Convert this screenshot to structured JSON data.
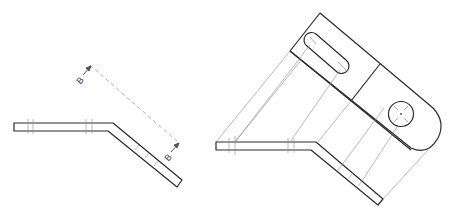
{
  "drawing": {
    "type": "auxiliary-view-projection",
    "views": [
      {
        "name": "edge-view",
        "description": "Bent plate shown edge-on with inclined segment"
      },
      {
        "name": "auxiliary-view",
        "description": "True-size view of inclined face with slot and hole, projected from edge view"
      }
    ],
    "section_markers": {
      "start_label": "B",
      "end_label": "B"
    },
    "colors": {
      "object_line": "#2a2a2a",
      "projection_line": "#8a8a8a",
      "cutting_plane": "#9a9a9a",
      "background": "#ffffff"
    }
  }
}
